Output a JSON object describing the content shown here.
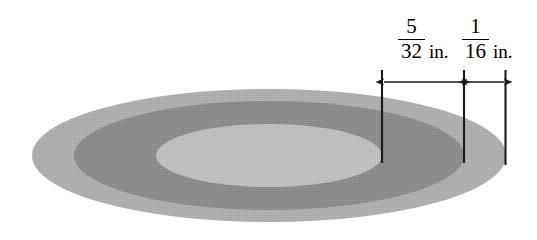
{
  "figure": {
    "background_color": "#ffffff"
  },
  "shape": {
    "kind": "concentric-ellipses",
    "outer_ring": {
      "name": "outer-ring",
      "fill_color": "#aeaeae",
      "cx": 269,
      "cy": 155.5,
      "rx": 237,
      "ry": 66.5
    },
    "dark_ring": {
      "name": "dark-ring",
      "fill_color": "#8a8a8a",
      "cx": 269,
      "cy": 155.5,
      "rx": 195,
      "ry": 54.5
    },
    "inner_hole": {
      "name": "inner-hole",
      "fill_color": "#bfbfbf",
      "cx": 269,
      "cy": 155.5,
      "rx": 113,
      "ry": 31.5
    }
  },
  "dimensions": [
    {
      "id": "dim-a",
      "numerator": "5",
      "denominator": "32",
      "unit": "in.",
      "value": 0.15625,
      "measures": "dark ring width",
      "arrow_y": 82,
      "arrow_x_start": 383,
      "arrow_x_end": 463
    },
    {
      "id": "dim-b",
      "numerator": "1",
      "denominator": "16",
      "unit": "in.",
      "value": 0.0625,
      "measures": "outer light ring width",
      "arrow_y": 82,
      "arrow_x_start": 466,
      "arrow_x_end": 505
    }
  ],
  "extension_lines": [
    {
      "id": "ext-line-inner",
      "x": 382,
      "y_top": 70,
      "y_bottom": 163
    },
    {
      "id": "ext-line-middle",
      "x": 464,
      "y_top": 70,
      "y_bottom": 163
    },
    {
      "id": "ext-line-outer",
      "x": 505.5,
      "y_top": 70,
      "y_bottom": 165
    }
  ],
  "colors": {
    "line": "#1a1a1a",
    "text": "#000000",
    "outer_ring": "#aeaeae",
    "dark_ring": "#8a8a8a",
    "inner_hole": "#bfbfbf"
  }
}
